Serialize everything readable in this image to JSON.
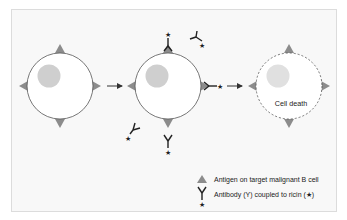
{
  "diagram": {
    "title": "",
    "stages": [
      {
        "name": "target-cell",
        "state": "intact"
      },
      {
        "name": "antibody-binding-cell",
        "state": "antibodies binding antigens"
      },
      {
        "name": "dying-cell",
        "state": "dead",
        "label": "Cell death"
      }
    ],
    "cell_death_label": "Cell death",
    "legend": {
      "antigen": "Antigen on target malignant B cell",
      "antibody": "Antibody (γ) coupled to ricin (★)",
      "antibody_prefix": "Antibody (",
      "antibody_y_glyph": "Y",
      "antibody_middle": ") coupled to ricin (",
      "antibody_star_glyph": "★",
      "antibody_suffix": ")"
    },
    "colors": {
      "frame_bg": "#f8f8f8",
      "frame_border": "#dcdcdc",
      "cell_fill": "#ffffff",
      "cell_stroke": "#555555",
      "nucleus": "#cfcfcf",
      "antigen": "#8c8c8c",
      "antibody": "#222222",
      "arrow": "#333333"
    }
  }
}
